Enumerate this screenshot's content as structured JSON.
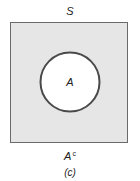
{
  "diagram": {
    "type": "venn",
    "universe_label": "S",
    "set_label": "A",
    "complement_label": "A",
    "complement_superscript": "c",
    "caption": "(c)",
    "colors": {
      "universe_fill": "#e6e6e6",
      "universe_stroke": "#6a6a6a",
      "set_fill": "#ffffff",
      "set_stroke": "#4a4a4a"
    }
  }
}
